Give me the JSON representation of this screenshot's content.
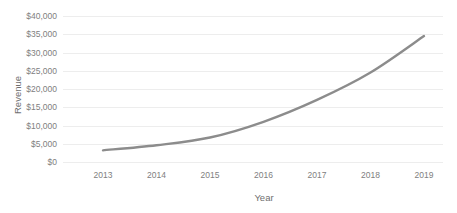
{
  "chart_data": {
    "type": "line",
    "title": "",
    "xlabel": "Year",
    "ylabel": "Revenue",
    "categories": [
      "2013",
      "2014",
      "2015",
      "2016",
      "2017",
      "2018",
      "2019"
    ],
    "x": [
      2013,
      2014,
      2015,
      2016,
      2017,
      2018,
      2019
    ],
    "values": [
      3200,
      4600,
      6700,
      11000,
      17000,
      24500,
      34500
    ],
    "series": [
      {
        "name": "Revenue",
        "values": [
          3200,
          4600,
          6700,
          11000,
          17000,
          24500,
          34500
        ]
      }
    ],
    "ylim": [
      0,
      40000
    ],
    "y_ticks": [
      0,
      5000,
      10000,
      15000,
      20000,
      25000,
      30000,
      35000,
      40000
    ],
    "y_tick_labels": [
      "$0",
      "$5,000",
      "$10,000",
      "$15,000",
      "$20,000",
      "$25,000",
      "$30,000",
      "$35,000",
      "$40,000"
    ],
    "x_tick_labels": [
      "2013",
      "2014",
      "2015",
      "2016",
      "2017",
      "2018",
      "2019"
    ],
    "grid": "horizontal",
    "legend": "none",
    "smoothed": true,
    "colors": {
      "line": "#8c8c8c",
      "gridline": "#ededed",
      "tick_text": "#808080",
      "axis_title": "#6f6f6f",
      "background": "#ffffff"
    }
  }
}
